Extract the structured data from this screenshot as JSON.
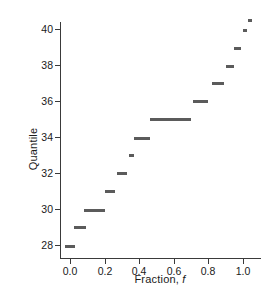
{
  "chart_data": {
    "type": "scatter",
    "title": "",
    "xlabel": "Fraction, f",
    "ylabel": "Quantile",
    "xlim": [
      -0.09,
      1.11
    ],
    "ylim": [
      26.9,
      41.1
    ],
    "xticks": [
      0.0,
      0.2,
      0.4,
      0.6,
      0.8,
      1.0
    ],
    "xticklabels": [
      "0.0",
      "0.2",
      "0.4",
      "0.6",
      "0.8",
      "1.0"
    ],
    "yticks": [
      28,
      30,
      32,
      34,
      36,
      38,
      40
    ],
    "yticklabels": [
      "28",
      "30",
      "32",
      "34",
      "36",
      "38",
      "40"
    ],
    "grid": false,
    "legend": null,
    "marker": "horizontal-bar",
    "marker_color": "#5b5b5b",
    "segments": [
      {
        "quantile": 27.9,
        "f_start": -0.03,
        "f_end": 0.03
      },
      {
        "quantile": 29.0,
        "f_start": 0.02,
        "f_end": 0.09
      },
      {
        "quantile": 29.9,
        "f_start": 0.08,
        "f_end": 0.2
      },
      {
        "quantile": 31.0,
        "f_start": 0.2,
        "f_end": 0.26
      },
      {
        "quantile": 32.0,
        "f_start": 0.27,
        "f_end": 0.33
      },
      {
        "quantile": 33.0,
        "f_start": 0.34,
        "f_end": 0.37
      },
      {
        "quantile": 33.9,
        "f_start": 0.37,
        "f_end": 0.46
      },
      {
        "quantile": 35.0,
        "f_start": 0.46,
        "f_end": 0.7
      },
      {
        "quantile": 36.0,
        "f_start": 0.71,
        "f_end": 0.8
      },
      {
        "quantile": 37.0,
        "f_start": 0.82,
        "f_end": 0.89
      },
      {
        "quantile": 37.9,
        "f_start": 0.9,
        "f_end": 0.95
      },
      {
        "quantile": 38.9,
        "f_start": 0.95,
        "f_end": 0.99
      },
      {
        "quantile": 39.9,
        "f_start": 1.0,
        "f_end": 1.02
      },
      {
        "quantile": 40.5,
        "f_start": 1.03,
        "f_end": 1.05
      }
    ],
    "x": [
      0.0,
      0.055,
      0.14,
      0.23,
      0.3,
      0.355,
      0.415,
      0.58,
      0.755,
      0.855,
      0.925,
      0.97,
      1.01,
      1.04
    ],
    "values": [
      27.9,
      29.0,
      29.9,
      31.0,
      32.0,
      33.0,
      33.9,
      35.0,
      36.0,
      37.0,
      37.9,
      38.9,
      39.9,
      40.5
    ]
  }
}
